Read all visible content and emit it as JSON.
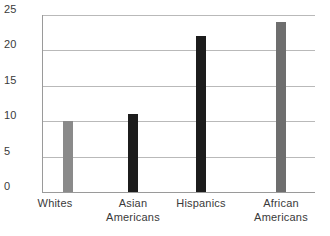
{
  "chart_data": {
    "type": "bar",
    "title": "",
    "subtitle": "",
    "xlabel": "",
    "ylabel": "",
    "categories": [
      "Whites",
      "Asian Americans",
      "Hispanics",
      "African Americans"
    ],
    "category_lines": [
      [
        "Whites"
      ],
      [
        "Asian",
        "Americans"
      ],
      [
        "Hispanics"
      ],
      [
        "African",
        "Americans"
      ]
    ],
    "values": [
      10,
      11,
      22,
      24
    ],
    "bar_colors": [
      "#8a8a8a",
      "#1c1c1c",
      "#1c1c1c",
      "#6e6e6e"
    ],
    "ylim": [
      0,
      25
    ],
    "yticks": [
      0,
      5,
      10,
      15,
      20,
      25
    ],
    "ytick_labels": [
      "0",
      "5",
      "10",
      "15",
      "20",
      "25"
    ],
    "grid": true,
    "grid_axis": "y",
    "legend": false,
    "legend_position": "none",
    "annotations": [],
    "axis_color": "#9a9a9a",
    "grid_color": "#b9b9b9",
    "text_color": "#3a3a3a",
    "background": "#ffffff"
  }
}
